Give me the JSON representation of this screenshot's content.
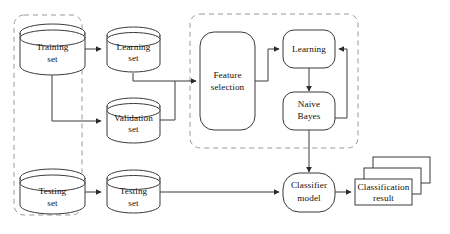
{
  "diagram": {
    "colors": {
      "shape_stroke": "#3a3a3a",
      "dashed_stroke": "#9a9a9a",
      "text": "#111111",
      "background": "#ffffff"
    },
    "nodes": {
      "training_set": {
        "line1": "Training",
        "line2": "set",
        "shape": "cylinder"
      },
      "learning_set": {
        "line1": "Learning",
        "line2": "set",
        "shape": "cylinder"
      },
      "validation_set": {
        "line1": "Validation",
        "line2": "set",
        "shape": "cylinder"
      },
      "testing_set_left": {
        "line1": "Testing",
        "line2": "set",
        "shape": "cylinder"
      },
      "testing_set_right": {
        "line1": "Testing",
        "line2": "set",
        "shape": "cylinder"
      },
      "feature_selection": {
        "line1": "Feature",
        "line2": "selection",
        "shape": "rounded-rect"
      },
      "learning": {
        "line1": "Learning",
        "line2": "",
        "shape": "rounded-rect"
      },
      "naive_bayes": {
        "line1": "Naive",
        "line2": "Bayes",
        "shape": "rounded-rect"
      },
      "classifier_model": {
        "line1": "Classifier",
        "line2": "model",
        "shape": "rounded-rect"
      },
      "classification_result": {
        "line1": "Classification",
        "line2": "result",
        "shape": "stacked-rect"
      }
    },
    "groups": {
      "data_split_group": {
        "label": "",
        "style": "dashed"
      },
      "model_build_group": {
        "label": "",
        "style": "dashed"
      }
    }
  }
}
